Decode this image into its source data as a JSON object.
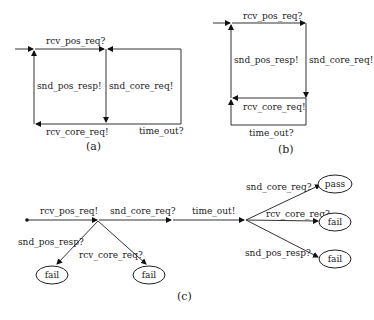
{
  "diagrams": {
    "a": {
      "caption": "(a)",
      "labels": {
        "top": "rcv_pos_req?",
        "left": "snd_pos_resp!",
        "middle": "snd_core_req!",
        "bottom": "rcv_core_req!",
        "right": "time_out?"
      }
    },
    "b": {
      "caption": "(b)",
      "labels": {
        "top": "rcv_pos_req?",
        "left": "snd_pos_resp!",
        "right": "snd_core_req!",
        "middle": "rcv_core_req!",
        "bottom": "time_out?"
      }
    },
    "c": {
      "caption": "(c)",
      "main_path": [
        "rcv_pos_req!",
        "snd_core_req?",
        "time_out!"
      ],
      "branches_first": [
        {
          "label": "snd_pos_resp?",
          "verdict": "fail"
        },
        {
          "label": "rcv_core_req?",
          "verdict": "fail"
        }
      ],
      "branches_last": [
        {
          "label": "snd_core_req?",
          "verdict": "pass"
        },
        {
          "label": "rcv_core_req?",
          "verdict": "fail"
        },
        {
          "label": "snd_pos_resp?",
          "verdict": "fail"
        }
      ]
    }
  }
}
